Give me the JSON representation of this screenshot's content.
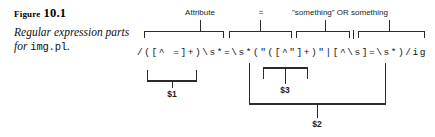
{
  "figure": {
    "label_word": "Figure",
    "label_number": "10.1",
    "description_prefix": "Regular expression parts for ",
    "description_code": "img.pl",
    "description_suffix": "."
  },
  "code": {
    "regex": "/([^ =]+)\\s*=\\s*(\"([^\"]+)\"|[^\\s]=\\s*)/ig"
  },
  "annotations": {
    "top": [
      {
        "id": "attribute",
        "text": "Attribute"
      },
      {
        "id": "equals",
        "text": "="
      },
      {
        "id": "something-or-something",
        "text": "\"something\" OR something"
      }
    ],
    "bottom": [
      {
        "id": "capture-1",
        "text": "$1"
      },
      {
        "id": "capture-3",
        "text": "$3"
      },
      {
        "id": "capture-2",
        "text": "$2"
      }
    ]
  },
  "colors": {
    "ink": "#1a1a1a",
    "rule": "#2b2b2b",
    "background": "#ffffff"
  }
}
